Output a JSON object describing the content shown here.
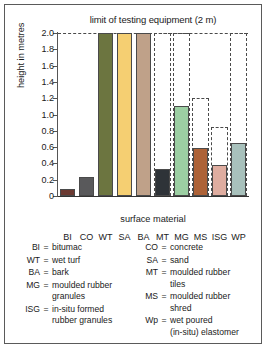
{
  "chart_data": {
    "type": "bar",
    "title": "limit of testing equipment (2 m)",
    "xlabel": "surface material",
    "ylabel": "height in metres",
    "ylim": [
      0,
      2.0
    ],
    "ytick_labels": [
      "0",
      "0.2",
      "0.4",
      "0.6",
      "0.8",
      "1.0",
      "1.2",
      "1.4",
      "1.6",
      "1.8",
      "2.0"
    ],
    "ytick_values": [
      0,
      0.2,
      0.4,
      0.6,
      0.8,
      1.0,
      1.2,
      1.4,
      1.6,
      1.8,
      2.0
    ],
    "grid": false,
    "legend_position": "below-plot",
    "categories": [
      "BI",
      "CO",
      "WT",
      "SA",
      "BA",
      "MT",
      "MG",
      "MS",
      "ISG",
      "WP"
    ],
    "values": [
      0.09,
      0.23,
      2.0,
      2.0,
      2.0,
      0.33,
      1.11,
      0.59,
      0.385,
      0.65
    ],
    "upper_limits": [
      null,
      null,
      null,
      null,
      null,
      2.0,
      2.0,
      1.2,
      0.85,
      2.0
    ],
    "bar_colors": [
      "#6b3a32",
      "#59595b",
      "#6c7540",
      "#f5cf72",
      "#bfa189",
      "#2e3338",
      "#9ccfa3",
      "#ad6237",
      "#dfada0",
      "#a8c1bc"
    ],
    "annotations": [
      "limit of testing equipment (2 m)"
    ]
  },
  "legend": {
    "left": [
      {
        "abbr": "BI",
        "eq": "=",
        "def": "bitumac",
        "cont": ""
      },
      {
        "abbr": "WT",
        "eq": "=",
        "def": "wet turf",
        "cont": ""
      },
      {
        "abbr": "BA",
        "eq": "=",
        "def": "bark",
        "cont": ""
      },
      {
        "abbr": "MG",
        "eq": "=",
        "def": "moulded rubber",
        "cont": "granules"
      },
      {
        "abbr": "ISG",
        "eq": "=",
        "def": "in-situ formed",
        "cont": "rubber granules"
      }
    ],
    "right": [
      {
        "abbr": "CO",
        "eq": "=",
        "def": "concrete",
        "cont": ""
      },
      {
        "abbr": "SA",
        "eq": "=",
        "def": "sand",
        "cont": ""
      },
      {
        "abbr": "MT",
        "eq": "=",
        "def": "moulded rubber",
        "cont": "tiles"
      },
      {
        "abbr": "MS",
        "eq": "=",
        "def": "moulded rubber",
        "cont": "shred"
      },
      {
        "abbr": "Wp",
        "eq": "=",
        "def": "wet poured",
        "cont": "(in-situ) elastomer"
      }
    ]
  }
}
